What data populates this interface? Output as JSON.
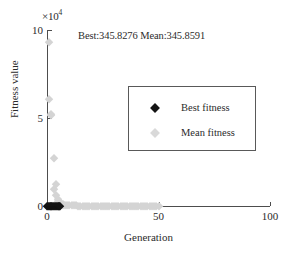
{
  "figure": {
    "exponent_prefix": "×10",
    "exponent_power": "4",
    "title": "Best:345.8276 Mean:345.8591",
    "background_color": "#ffffff",
    "axis_color": "#4d4d4d"
  },
  "legend": {
    "position": "upper-center-right",
    "entries": [
      {
        "label": "Best fitness",
        "marker": "diamond",
        "color": "#141414",
        "name": "best-fitness"
      },
      {
        "label": "Mean fitness",
        "marker": "diamond",
        "color": "#d9d9d9",
        "name": "mean-fitness"
      }
    ]
  },
  "chart_data": {
    "type": "scatter",
    "title": "Best:345.8276 Mean:345.8591",
    "xlabel": "Generation",
    "ylabel": "Fitness value",
    "y_multiplier": "×10^4",
    "xlim": [
      0,
      100
    ],
    "ylim": [
      0,
      10
    ],
    "xticks": [
      0,
      50,
      100
    ],
    "xticklabels": [
      "0",
      "50",
      "100"
    ],
    "yticks": [
      0,
      5,
      10
    ],
    "yticklabels": [
      "0",
      "5",
      "10"
    ],
    "grid": false,
    "annotations": {
      "best_value": 345.8276,
      "mean_value": 345.8591
    },
    "series": [
      {
        "name": "Mean fitness",
        "marker": "diamond",
        "color": "#d4d4d4",
        "x": [
          1,
          1,
          2,
          2,
          3,
          3,
          4,
          4,
          5,
          5,
          6,
          6,
          7,
          7,
          8,
          9,
          10,
          11,
          12,
          13,
          14,
          15,
          16,
          17,
          18,
          19,
          20,
          21,
          22,
          23,
          24,
          25,
          26,
          27,
          28,
          29,
          30,
          31,
          32,
          33,
          34,
          35,
          36,
          37,
          38,
          39,
          40,
          41,
          42,
          43,
          44,
          45,
          46,
          47,
          48,
          49,
          50
        ],
        "y": [
          9.3,
          6.1,
          5.2,
          5.15,
          2.75,
          0.95,
          1.25,
          0.62,
          0.38,
          0.28,
          0.2,
          0.14,
          0.1,
          0.08,
          0.06,
          0.05,
          0.04,
          0.035,
          0.03,
          0.03,
          0.025,
          0.025,
          0.02,
          0.02,
          0.02,
          0.02,
          0.02,
          0.02,
          0.02,
          0.02,
          0.02,
          0.02,
          0.02,
          0.02,
          0.02,
          0.02,
          0.02,
          0.02,
          0.02,
          0.02,
          0.02,
          0.02,
          0.02,
          0.02,
          0.02,
          0.02,
          0.02,
          0.02,
          0.02,
          0.02,
          0.02,
          0.02,
          0.02,
          0.02,
          0.02,
          0.02,
          0.02
        ]
      },
      {
        "name": "Best fitness",
        "marker": "diamond",
        "color": "#141414",
        "x": [
          0,
          0.4,
          0.8,
          1.2,
          1.6,
          2,
          2.4,
          2.8,
          3.2,
          3.6,
          4,
          4.4,
          4.8,
          5.2,
          5.6,
          6
        ],
        "y": [
          0.02,
          0.02,
          0.02,
          0.02,
          0.02,
          0.02,
          0.02,
          0.02,
          0.02,
          0.02,
          0.02,
          0.02,
          0.02,
          0.02,
          0.02,
          0.02
        ]
      }
    ]
  }
}
